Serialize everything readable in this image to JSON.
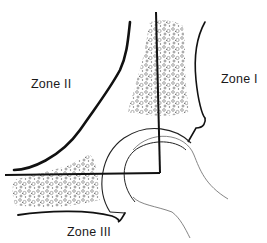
{
  "diagram": {
    "type": "anatomical-zone-diagram",
    "labels": {
      "zone_1": "Zone I",
      "zone_2": "Zone II",
      "zone_3": "Zone III"
    },
    "colors": {
      "line": "#111111",
      "thin_line": "#666666",
      "stipple": "#555555",
      "background": "#ffffff"
    }
  }
}
